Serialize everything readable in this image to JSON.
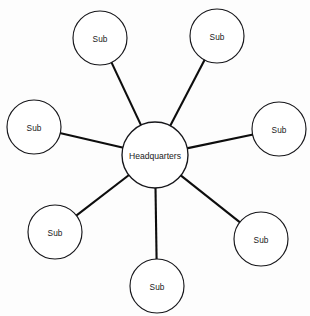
{
  "diagram": {
    "type": "star-network",
    "background_color": "#fdfdfd",
    "node_fill_color": "#ffffff",
    "node_stroke_color": "#16161a",
    "edge_color": "#0d0d0d",
    "label_color": "#1a1a1a",
    "hub": {
      "id": "headquarters",
      "label": "Headquarters",
      "cx": 155,
      "cy": 155,
      "r": 33
    },
    "nodes": [
      {
        "id": "sub-top-left",
        "label": "Sub",
        "cx": 100,
        "cy": 38,
        "r": 27
      },
      {
        "id": "sub-top-right",
        "label": "Sub",
        "cx": 217,
        "cy": 36,
        "r": 27
      },
      {
        "id": "sub-left",
        "label": "Sub",
        "cx": 34,
        "cy": 127,
        "r": 27
      },
      {
        "id": "sub-right",
        "label": "Sub",
        "cx": 279,
        "cy": 129,
        "r": 27
      },
      {
        "id": "sub-bottom-left",
        "label": "Sub",
        "cx": 55,
        "cy": 232,
        "r": 27
      },
      {
        "id": "sub-bottom-right",
        "label": "Sub",
        "cx": 261,
        "cy": 239,
        "r": 27
      },
      {
        "id": "sub-bottom",
        "label": "Sub",
        "cx": 157,
        "cy": 286,
        "r": 27
      }
    ],
    "edges": [
      {
        "id": "edge-hub-sub-top-left",
        "from": "headquarters",
        "to": "sub-top-left"
      },
      {
        "id": "edge-hub-sub-top-right",
        "from": "headquarters",
        "to": "sub-top-right"
      },
      {
        "id": "edge-hub-sub-left",
        "from": "headquarters",
        "to": "sub-left"
      },
      {
        "id": "edge-hub-sub-right",
        "from": "headquarters",
        "to": "sub-right"
      },
      {
        "id": "edge-hub-sub-bottom-left",
        "from": "headquarters",
        "to": "sub-bottom-left"
      },
      {
        "id": "edge-hub-sub-bottom-right",
        "from": "headquarters",
        "to": "sub-bottom-right"
      },
      {
        "id": "edge-hub-sub-bottom",
        "from": "headquarters",
        "to": "sub-bottom"
      }
    ]
  }
}
